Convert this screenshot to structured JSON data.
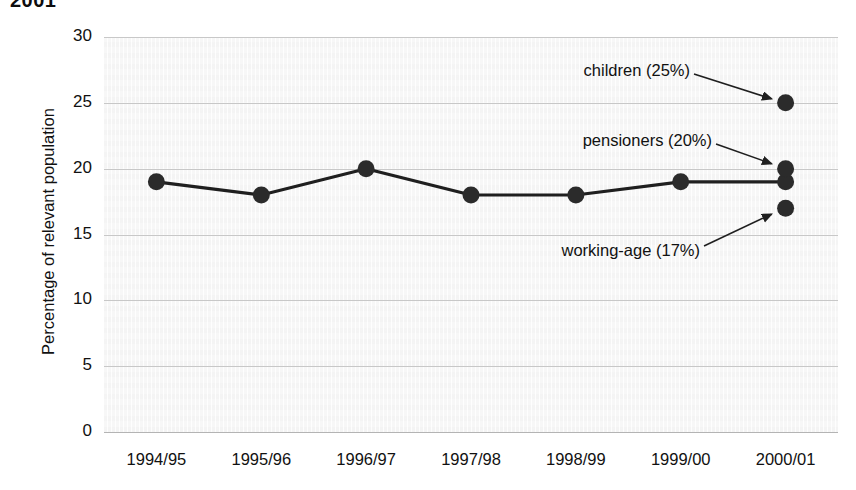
{
  "title_fragment": "2001",
  "chart_data": {
    "type": "line",
    "title": "",
    "xlabel": "",
    "ylabel": "Percentage of relevant population",
    "categories": [
      "1994/95",
      "1995/96",
      "1996/97",
      "1997/98",
      "1998/99",
      "1999/00",
      "2000/01"
    ],
    "ylim": [
      0,
      30
    ],
    "yticks": [
      0,
      5,
      10,
      15,
      20,
      25,
      30
    ],
    "ytick_labels": [
      "0",
      "5",
      "10",
      "15",
      "20",
      "25",
      "30"
    ],
    "grid": true,
    "legend": "none",
    "series": [
      {
        "name": "all (line series)",
        "values": [
          19,
          18,
          20,
          18,
          18,
          19,
          19
        ],
        "marker": "filled-circle",
        "color": "#1f1f1f"
      }
    ],
    "extra_points": [
      {
        "name": "children",
        "category": "2000/01",
        "value": 25,
        "label": "children (25%)"
      },
      {
        "name": "pensioners",
        "category": "2000/01",
        "value": 20,
        "label": "pensioners (20%)"
      },
      {
        "name": "working-age",
        "category": "2000/01",
        "value": 17,
        "label": "working-age (17%)"
      }
    ],
    "annotations": [
      {
        "name": "children-annotation",
        "text": "children (25%)",
        "value": 25,
        "percent": "25%"
      },
      {
        "name": "pensioners-annotation",
        "text": "pensioners (20%)",
        "value": 20,
        "percent": "20%"
      },
      {
        "name": "working-age-annotation",
        "text": "working-age (17%)",
        "value": 17,
        "percent": "17%"
      }
    ],
    "colors": {
      "series_line": "#1f1f1f",
      "marker": "#2b2b2b",
      "gridline": "#c8c8c8",
      "plot_background": "#f7f7f7",
      "text": "#111111"
    }
  }
}
